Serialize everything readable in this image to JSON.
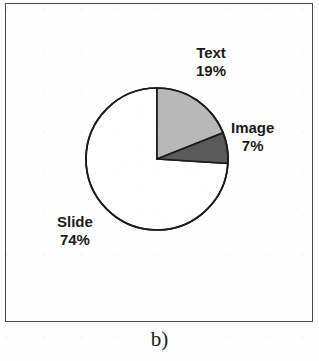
{
  "figure": {
    "caption": "b)"
  },
  "chart_data": {
    "type": "pie",
    "title": "",
    "labels": [
      "Text",
      "Image",
      "Slide"
    ],
    "values": [
      19,
      7,
      74
    ],
    "value_labels": [
      "19%",
      "7%",
      "74%"
    ],
    "units": "percent",
    "start_angle_deg": 0,
    "direction": "clockwise",
    "legend": "none",
    "annotations": [
      "Text 19%",
      "Image 7%",
      "Slide 74%"
    ],
    "slices": [
      {
        "label": "Text",
        "value": 19,
        "value_label": "19%",
        "color": "#b8b8b8",
        "outline": "#1b1b1b"
      },
      {
        "label": "Image",
        "value": 7,
        "value_label": "7%",
        "color": "#5a5a5a",
        "outline": "#1b1b1b"
      },
      {
        "label": "Slide",
        "value": 74,
        "value_label": "74%",
        "color": "#ffffff",
        "outline": "#1b1b1b"
      }
    ]
  },
  "colors": {
    "text_slice": "#b8b8b8",
    "image_slice": "#5a5a5a",
    "slide_slice": "#ffffff",
    "outline": "#1b1b1b",
    "frame": "#4a4a4a",
    "label_text": "#1b1b1b"
  }
}
